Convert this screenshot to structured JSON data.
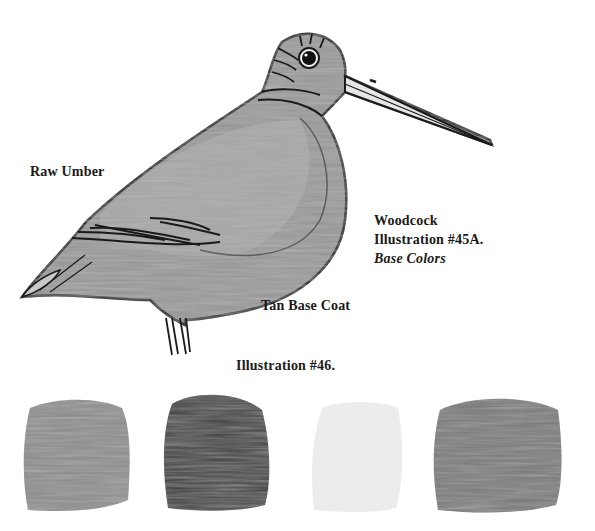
{
  "illustration": {
    "subject": "woodcock-bird-drawing",
    "labels": {
      "raw_umber": "Raw Umber",
      "tan_base_coat": "Tan Base Coat"
    },
    "caption": {
      "line1": "Woodcock",
      "line2": "Illustration #45A.",
      "line3": "Base Colors"
    }
  },
  "swatches": {
    "title": "Illustration #46.",
    "items": [
      {
        "name": "swatch-1",
        "tone": "#8e8e8e"
      },
      {
        "name": "swatch-2",
        "tone": "#3d3d3d"
      },
      {
        "name": "swatch-3",
        "tone": "#ececec"
      },
      {
        "name": "swatch-4",
        "tone": "#7a7a7a"
      }
    ]
  }
}
